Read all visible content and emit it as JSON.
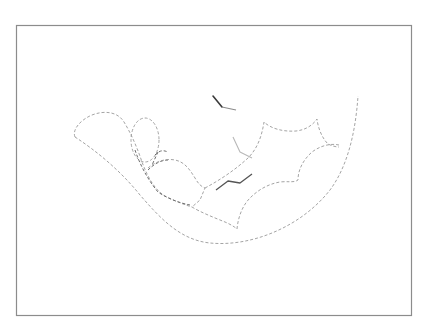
{
  "figure": {
    "frame": {
      "x": 16,
      "y": 25,
      "width": 395,
      "height": 290,
      "stroke": "#8c8c8c"
    },
    "colors": {
      "surface_outline": "#9a9a9a",
      "ligand_dark": "#3a3a3a",
      "ligand_light": "#b8b8b8",
      "background": "#ffffff"
    },
    "elements": [
      {
        "id": "outer-pocket-arc",
        "type": "dashed-outline"
      },
      {
        "id": "left-lobe",
        "type": "dashed-outline"
      },
      {
        "id": "oval-cavity",
        "type": "dashed-outline"
      },
      {
        "id": "middle-lobe",
        "type": "dashed-outline"
      },
      {
        "id": "upper-right-lobe",
        "type": "dashed-outline"
      },
      {
        "id": "lower-right-lobe",
        "type": "dashed-outline"
      },
      {
        "id": "ligand-zigzag",
        "type": "solid-stroke"
      },
      {
        "id": "ligand-top-fragment",
        "type": "solid-stroke"
      },
      {
        "id": "ligand-light-fragment",
        "type": "solid-stroke"
      }
    ]
  }
}
